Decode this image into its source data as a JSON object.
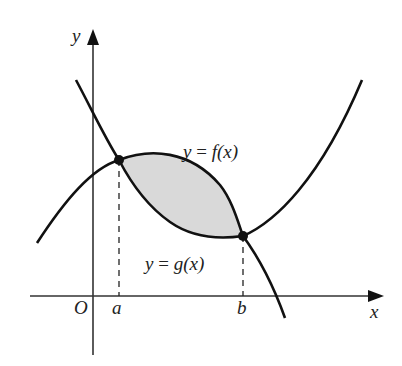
{
  "diagram": {
    "type": "area-between-curves",
    "labels": {
      "x_axis": "x",
      "y_axis": "y",
      "origin": "O",
      "a": "a",
      "b": "b",
      "f_label_lhs": "y",
      "f_label_eq": " = ",
      "f_label_rhs": "f(x)",
      "g_label_lhs": "y",
      "g_label_eq": " = ",
      "g_label_rhs": "g(x)"
    },
    "colors": {
      "stroke": "#111111",
      "axis": "#333333",
      "shaded_region": "#d9d9d9"
    },
    "points": [
      {
        "name": "intersection-a",
        "x_label": "a"
      },
      {
        "name": "intersection-b",
        "x_label": "b"
      }
    ]
  }
}
